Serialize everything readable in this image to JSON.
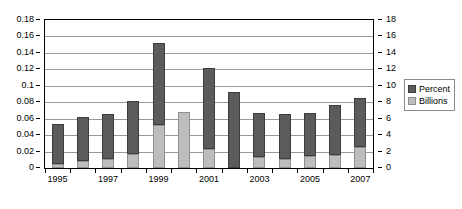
{
  "chart_data": {
    "type": "bar",
    "subtype": "stacked-column",
    "title": "",
    "subtitle": "",
    "xlabel": "",
    "ylabel": "",
    "categories": [
      "1995",
      "1996",
      "1997",
      "1998",
      "1999",
      "2000",
      "2001",
      "2002",
      "2003",
      "2004",
      "2005",
      "2006",
      "2007"
    ],
    "tick_labels_visible": [
      "1995",
      "1997",
      "1999",
      "2001",
      "2003",
      "2005",
      "2007"
    ],
    "axes": {
      "left": {
        "label": "",
        "ylim": [
          0,
          0.18
        ],
        "step": 0.02,
        "ticks": [
          "0",
          "0.02",
          "0.04",
          "0.06",
          "0.08",
          "0.1",
          "0.12",
          "0.14",
          "0.16",
          "0.18"
        ],
        "series": "Percent"
      },
      "right": {
        "label": "",
        "ylim": [
          0,
          18
        ],
        "step": 2,
        "ticks": [
          "0",
          "2",
          "4",
          "6",
          "8",
          "10",
          "12",
          "14",
          "16",
          "18"
        ],
        "series": "Billions"
      }
    },
    "grid": true,
    "legend": {
      "position": "right",
      "entries": [
        {
          "name": "Percent",
          "color": "#5b5b5b"
        },
        {
          "name": "Billions",
          "color": "#bdbdbd"
        }
      ]
    },
    "series": [
      {
        "name": "Billions",
        "axis": "right",
        "color": "#bdbdbd",
        "values": [
          0.5,
          0.8,
          1.1,
          1.7,
          5.2,
          6.8,
          2.3,
          0.0,
          1.4,
          1.1,
          1.5,
          1.6,
          2.5
        ]
      },
      {
        "name": "Percent",
        "axis": "left",
        "color": "#5b5b5b",
        "values": [
          0.048,
          0.054,
          0.055,
          0.065,
          0.1,
          0.0,
          0.099,
          0.092,
          0.053,
          0.055,
          0.052,
          0.061,
          0.06
        ]
      }
    ],
    "stacked_totals": [
      0.053,
      0.062,
      0.066,
      0.082,
      0.152,
      0.168,
      0.122,
      0.092,
      0.067,
      0.066,
      0.067,
      0.077,
      0.085
    ]
  },
  "legend": {
    "percent_label": "Percent",
    "billions_label": "Billions"
  }
}
